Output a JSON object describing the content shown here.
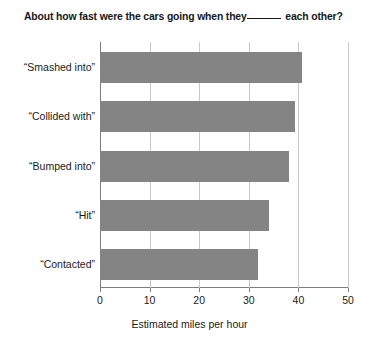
{
  "chart_data": {
    "type": "bar",
    "orientation": "horizontal",
    "title_prefix": "About how fast were the cars going when they",
    "title_suffix": "each other?",
    "categories": [
      "“Smashed into”",
      "“Collided with”",
      "“Bumped into”",
      "“Hit”",
      "“Contacted”"
    ],
    "values": [
      40.8,
      39.3,
      38.1,
      34.0,
      31.8
    ],
    "xlabel": "Estimated miles per hour",
    "ylabel": "",
    "xlim": [
      0,
      50
    ],
    "xticks": [
      0,
      10,
      20,
      30,
      40,
      50
    ],
    "xtick_labels": [
      "0",
      "10",
      "20",
      "30",
      "40",
      "50"
    ],
    "grid": true,
    "grid_axis": "x",
    "legend": false,
    "bar_color": "#848484",
    "grid_color": "#c9c9c9",
    "axis_color": "#7d7d7d",
    "background_color": "#ffffff"
  }
}
